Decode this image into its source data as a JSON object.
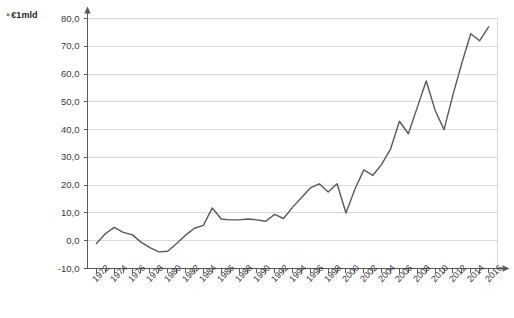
{
  "unit_label": {
    "marker": "×",
    "text": "€1mld"
  },
  "chart_data": {
    "type": "line",
    "title": "",
    "subtitle": "",
    "xlabel": "",
    "ylabel": "× €1mld",
    "grid": true,
    "legend": "none",
    "xlim": [
      1971,
      2017
    ],
    "ylim": [
      -10,
      80
    ],
    "ytick_labels": [
      "80,0",
      "70,0",
      "60,0",
      "50,0",
      "40,0",
      "30,0",
      "20,0",
      "10,0",
      "0,0",
      "-10,0"
    ],
    "ytick_values": [
      80,
      70,
      60,
      50,
      40,
      30,
      20,
      10,
      0,
      -10
    ],
    "xtick_labels": [
      "1972",
      "1974",
      "1976",
      "1978",
      "1980",
      "1982",
      "1984",
      "1986",
      "1988",
      "1990",
      "1992",
      "1994",
      "1996",
      "1998",
      "2000",
      "2002",
      "2004",
      "2006",
      "2008",
      "2010",
      "2012",
      "2014",
      "2016"
    ],
    "xtick_values": [
      1972,
      1974,
      1976,
      1978,
      1980,
      1982,
      1984,
      1986,
      1988,
      1990,
      1992,
      1994,
      1996,
      1998,
      2000,
      2002,
      2004,
      2006,
      2008,
      2010,
      2012,
      2014,
      2016
    ],
    "x": [
      1972,
      1973,
      1974,
      1975,
      1976,
      1977,
      1978,
      1979,
      1980,
      1981,
      1982,
      1983,
      1984,
      1985,
      1986,
      1987,
      1988,
      1989,
      1990,
      1991,
      1992,
      1993,
      1994,
      1995,
      1996,
      1997,
      1998,
      1999,
      2000,
      2001,
      2002,
      2003,
      2004,
      2005,
      2006,
      2007,
      2008,
      2009,
      2010,
      2011,
      2012,
      2013,
      2014,
      2015,
      2016
    ],
    "values": [
      -1.0,
      2.5,
      4.8,
      3.0,
      2.2,
      -0.5,
      -2.5,
      -4.0,
      -3.8,
      -1.0,
      2.0,
      4.5,
      5.5,
      11.8,
      7.8,
      7.5,
      7.5,
      7.8,
      7.5,
      7.0,
      9.5,
      8.0,
      12.0,
      15.5,
      19.0,
      20.5,
      17.5,
      20.5,
      10.0,
      18.5,
      25.5,
      23.5,
      27.5,
      33.0,
      43.0,
      38.5,
      48.0,
      57.5,
      47.0,
      40.0,
      52.5,
      64.0,
      74.5,
      72.0,
      77.0
    ],
    "series_color": "#595959",
    "line_width": 1.4,
    "axis_color": "#595959",
    "grid_color": "#d9d9d9"
  }
}
